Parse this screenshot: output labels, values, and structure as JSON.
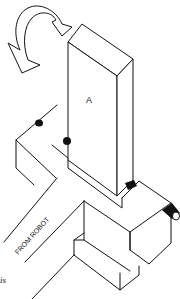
{
  "diagram": {
    "block_label": "A",
    "arm_label": "FROM ROBOT",
    "caption_fragment": "is",
    "elements": [
      {
        "name": "rotation-arrow",
        "description": "curved arrow indicating rotation of block A"
      },
      {
        "name": "block-a",
        "description": "tall rectangular block labeled A"
      },
      {
        "name": "gripper-assembly",
        "description": "cross-shaped gripper fixture attached to robot arm"
      },
      {
        "name": "robot-arm",
        "description": "arm extending to lower left, labeled FROM ROBOT"
      },
      {
        "name": "pins",
        "description": "cylindrical pins on gripper jaws"
      }
    ],
    "colors": {
      "line": "#111111",
      "background": "#ffffff"
    }
  }
}
